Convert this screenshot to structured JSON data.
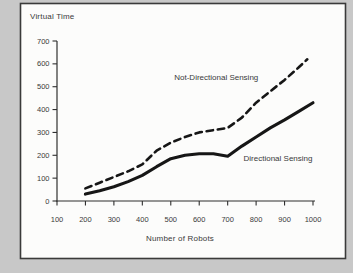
{
  "figure": {
    "background_color": "#c8c8c8",
    "frame_fill": "#fcfcfb",
    "frame_border_color": "#3a3a3a"
  },
  "chart_data": {
    "type": "line",
    "title": "",
    "ylabel": "Virtual Time",
    "xlabel": "Number of Robots",
    "x_axis": {
      "min": 100,
      "max": 1000,
      "ticks": [
        100,
        200,
        300,
        400,
        500,
        600,
        700,
        800,
        900,
        1000
      ]
    },
    "y_axis": {
      "min": 0,
      "max": 700,
      "ticks": [
        0,
        100,
        200,
        300,
        400,
        500,
        600,
        700
      ]
    },
    "grid": false,
    "legend": "inline-annotations",
    "axis_color": "#2f2f2f",
    "line_color": "#161616",
    "series": [
      {
        "name": "Not-Directional Sensing",
        "line_style": "dashed",
        "x": [
          200,
          250,
          300,
          350,
          400,
          450,
          500,
          550,
          600,
          650,
          700,
          750,
          800,
          850,
          900,
          950,
          980
        ],
        "values": [
          55,
          80,
          105,
          130,
          160,
          220,
          255,
          280,
          300,
          310,
          320,
          365,
          430,
          480,
          530,
          585,
          620
        ]
      },
      {
        "name": "Directional Sensing",
        "line_style": "solid",
        "x": [
          200,
          250,
          300,
          350,
          400,
          450,
          500,
          550,
          600,
          650,
          700,
          750,
          800,
          850,
          900,
          950,
          1000
        ],
        "values": [
          30,
          45,
          62,
          85,
          112,
          150,
          185,
          200,
          207,
          207,
          196,
          240,
          280,
          320,
          355,
          392,
          430
        ]
      }
    ],
    "annotations": [
      {
        "text": "Not-Directional Sensing",
        "x": 660,
        "y": 540
      },
      {
        "text": "Directional Sensing",
        "x": 877,
        "y": 188
      }
    ]
  }
}
